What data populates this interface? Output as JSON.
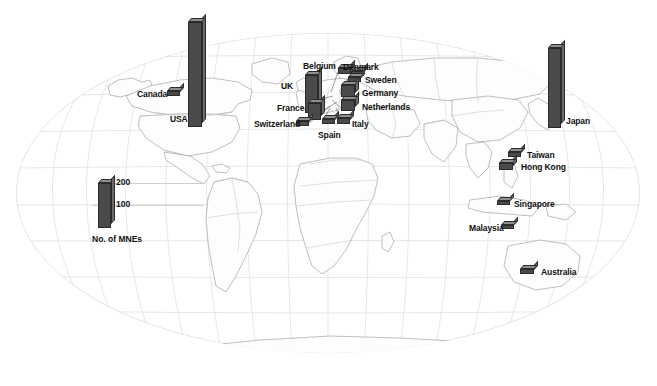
{
  "figure": {
    "projection": "robinson",
    "background_color": "#ffffff",
    "graticule_color": "#d8d8d8",
    "coastline_color": "#9a9a9a",
    "border_color": "#b5b5b5",
    "bar_color": "#4a4a4a",
    "bar_top_color": "#8f8f8f",
    "bar_side_color": "#6b6b6b",
    "bar_outline_color": "#2b2b2b",
    "label_color": "#111111"
  },
  "legend": {
    "caption": "No. of MNEs",
    "ticks": [
      {
        "value": "200"
      },
      {
        "value": "100"
      }
    ]
  },
  "chart_data": {
    "type": "bar",
    "title": "",
    "xlabel": "",
    "ylabel": "No. of MNEs",
    "ylim": [
      0,
      470
    ],
    "grid": false,
    "legend_position": "lower-left",
    "categories": [
      "USA",
      "Japan",
      "UK",
      "France",
      "Germany",
      "Netherlands",
      "Canada",
      "Belgium",
      "Denmark",
      "Sweden",
      "Switzerland",
      "Spain",
      "Italy",
      "Taiwan",
      "Hong Kong",
      "Singapore",
      "Malaysia",
      "Australia"
    ],
    "values": [
      460,
      355,
      170,
      100,
      62,
      58,
      30,
      28,
      24,
      26,
      22,
      20,
      26,
      24,
      34,
      22,
      18,
      20
    ]
  },
  "countries": [
    {
      "name": "USA",
      "label": "USA",
      "value": 460,
      "label_x": 170,
      "label_y": 114,
      "bar_x": 188,
      "bar_base_y": 127,
      "bar_w": 14,
      "bar_h": 105,
      "leader": null
    },
    {
      "name": "Japan",
      "label": "Japan",
      "value": 355,
      "label_x": 566,
      "label_y": 116,
      "bar_x": 548,
      "bar_base_y": 128,
      "bar_w": 13,
      "bar_h": 80,
      "leader": null
    },
    {
      "name": "Canada",
      "label": "Canada",
      "value": 30,
      "label_x": 137,
      "label_y": 89,
      "bar_x": 167,
      "bar_base_y": 96,
      "bar_w": 13,
      "bar_h": 5,
      "leader": null
    },
    {
      "name": "UK",
      "label": "UK",
      "value": 170,
      "label_x": 281,
      "label_y": 81,
      "bar_x": 305,
      "bar_base_y": 113,
      "bar_w": 13,
      "bar_h": 38,
      "leader": {
        "x1": 318,
        "y1": 100,
        "x2": 333,
        "y2": 96
      }
    },
    {
      "name": "France",
      "label": "France",
      "value": 100,
      "label_x": 277,
      "label_y": 103,
      "bar_x": 308,
      "bar_base_y": 120,
      "bar_w": 13,
      "bar_h": 17,
      "leader": {
        "x1": 321,
        "y1": 112,
        "x2": 337,
        "y2": 102
      }
    },
    {
      "name": "Belgium",
      "label": "Belgium",
      "value": 28,
      "label_x": 303,
      "label_y": 61,
      "bar_x": 338,
      "bar_base_y": 74,
      "bar_w": 13,
      "bar_h": 6,
      "leader": {
        "x1": 338,
        "y1": 72,
        "x2": 331,
        "y2": 92
      }
    },
    {
      "name": "Denmark",
      "label": "Denmark",
      "value": 24,
      "label_x": 343,
      "label_y": 62,
      "bar_x": 351,
      "bar_base_y": 76,
      "bar_w": 13,
      "bar_h": 5,
      "leader": {
        "x1": 351,
        "y1": 74,
        "x2": 339,
        "y2": 92
      }
    },
    {
      "name": "Sweden",
      "label": "Sweden",
      "value": 26,
      "label_x": 365,
      "label_y": 75,
      "bar_x": 348,
      "bar_base_y": 82,
      "bar_w": 13,
      "bar_h": 5,
      "leader": {
        "x1": 348,
        "y1": 80,
        "x2": 340,
        "y2": 94
      }
    },
    {
      "name": "Germany",
      "label": "Germany",
      "value": 62,
      "label_x": 362,
      "label_y": 88,
      "bar_x": 341,
      "bar_base_y": 97,
      "bar_w": 14,
      "bar_h": 12,
      "leader": null
    },
    {
      "name": "Netherlands",
      "label": "Netherlands",
      "value": 58,
      "label_x": 362,
      "label_y": 102,
      "bar_x": 341,
      "bar_base_y": 111,
      "bar_w": 14,
      "bar_h": 11,
      "leader": {
        "x1": 341,
        "y1": 108,
        "x2": 332,
        "y2": 100
      }
    },
    {
      "name": "Switzerland",
      "label": "Switzerland",
      "value": 22,
      "label_x": 254,
      "label_y": 119,
      "bar_x": 296,
      "bar_base_y": 126,
      "bar_w": 13,
      "bar_h": 5,
      "leader": {
        "x1": 309,
        "y1": 123,
        "x2": 330,
        "y2": 106
      }
    },
    {
      "name": "Spain",
      "label": "Spain",
      "value": 20,
      "label_x": 318,
      "label_y": 130,
      "bar_x": 322,
      "bar_base_y": 124,
      "bar_w": 13,
      "bar_h": 5,
      "leader": {
        "x1": 322,
        "y1": 122,
        "x2": 330,
        "y2": 108
      }
    },
    {
      "name": "Italy",
      "label": "Italy",
      "value": 26,
      "label_x": 352,
      "label_y": 119,
      "bar_x": 337,
      "bar_base_y": 124,
      "bar_w": 13,
      "bar_h": 6,
      "leader": {
        "x1": 341,
        "y1": 120,
        "x2": 336,
        "y2": 108
      }
    },
    {
      "name": "Taiwan",
      "label": "Taiwan",
      "value": 24,
      "label_x": 527,
      "label_y": 150,
      "bar_x": 508,
      "bar_base_y": 157,
      "bar_w": 13,
      "bar_h": 5,
      "leader": null
    },
    {
      "name": "Hong Kong",
      "label": "Hong Kong",
      "value": 34,
      "label_x": 521,
      "label_y": 162,
      "bar_x": 499,
      "bar_base_y": 170,
      "bar_w": 14,
      "bar_h": 7,
      "leader": null
    },
    {
      "name": "Singapore",
      "label": "Singapore",
      "value": 22,
      "label_x": 514,
      "label_y": 199,
      "bar_x": 497,
      "bar_base_y": 205,
      "bar_w": 13,
      "bar_h": 4,
      "leader": null
    },
    {
      "name": "Malaysia",
      "label": "Malaysia",
      "value": 18,
      "label_x": 469,
      "label_y": 223,
      "bar_x": 501,
      "bar_base_y": 229,
      "bar_w": 13,
      "bar_h": 4,
      "leader": null
    },
    {
      "name": "Australia",
      "label": "Australia",
      "value": 20,
      "label_x": 541,
      "label_y": 267,
      "bar_x": 520,
      "bar_base_y": 274,
      "bar_w": 14,
      "bar_h": 5,
      "leader": null
    }
  ]
}
